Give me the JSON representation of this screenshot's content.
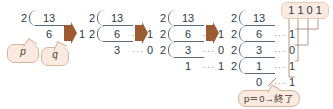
{
  "diagram": {
    "arrow_icon": "right-arrow-icon",
    "colors": {
      "bubble_fill": "#fbeae0",
      "bubble_border": "#d6b49c",
      "arrow": "#9c5b33",
      "text": "#2b3a4a",
      "rule": "#5a6b7d",
      "connector": "#b08a72"
    },
    "leader": "···",
    "stages": [
      {
        "name": "stage-1",
        "rows": [
          {
            "divisor": "2",
            "quotient": "13",
            "leader": "",
            "remainder": ""
          },
          {
            "divisor": "",
            "quotient": "6",
            "leader": "···",
            "remainder": "1"
          }
        ]
      },
      {
        "name": "stage-2",
        "rows": [
          {
            "divisor": "2",
            "quotient": "13",
            "leader": "",
            "remainder": ""
          },
          {
            "divisor": "2",
            "quotient": "6",
            "leader": "···",
            "remainder": "1"
          },
          {
            "divisor": "",
            "quotient": "3",
            "leader": "···",
            "remainder": "0"
          }
        ]
      },
      {
        "name": "stage-3",
        "rows": [
          {
            "divisor": "2",
            "quotient": "13",
            "leader": "",
            "remainder": ""
          },
          {
            "divisor": "2",
            "quotient": "6",
            "leader": "···",
            "remainder": "1"
          },
          {
            "divisor": "2",
            "quotient": "3",
            "leader": "···",
            "remainder": "0"
          },
          {
            "divisor": "",
            "quotient": "1",
            "leader": "···",
            "remainder": "1"
          }
        ]
      },
      {
        "name": "stage-4",
        "rows": [
          {
            "divisor": "2",
            "quotient": "13",
            "leader": "",
            "remainder": ""
          },
          {
            "divisor": "2",
            "quotient": "6",
            "leader": "···",
            "remainder": "1"
          },
          {
            "divisor": "2",
            "quotient": "3",
            "leader": "···",
            "remainder": "0"
          },
          {
            "divisor": "2",
            "quotient": "1",
            "leader": "···",
            "remainder": "1"
          },
          {
            "divisor": "",
            "quotient": "0",
            "leader": "···",
            "remainder": "1"
          }
        ]
      }
    ],
    "bubbles": [
      {
        "name": "bubble-p",
        "label": "p"
      },
      {
        "name": "bubble-q",
        "label": "q"
      }
    ],
    "result": {
      "name": "binary-result",
      "bits": [
        "1",
        "1",
        "0",
        "1"
      ]
    },
    "end_label": {
      "name": "end-condition-label",
      "text": "p＝0→終了"
    }
  }
}
